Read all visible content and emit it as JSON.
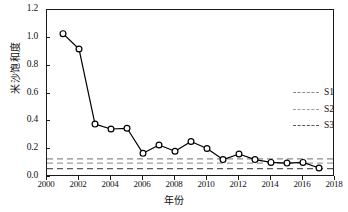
{
  "chart_data": {
    "type": "line",
    "title": "",
    "xlabel": "年份",
    "ylabel": "米沙饱和度",
    "xlim": [
      2000,
      2018
    ],
    "ylim": [
      0.0,
      1.2
    ],
    "xticks": [
      2000,
      2002,
      2004,
      2006,
      2008,
      2010,
      2012,
      2014,
      2016,
      2018
    ],
    "yticks": [
      "0.0",
      "0.2",
      "0.4",
      "0.6",
      "0.8",
      "1.0",
      "1.2"
    ],
    "grid": false,
    "legend_position": "center-right",
    "series": [
      {
        "name": "米沙饱和度",
        "marker": "open-circle",
        "color": "#000000",
        "x": [
          2001,
          2002,
          2003,
          2004,
          2005,
          2006,
          2007,
          2008,
          2009,
          2010,
          2011,
          2012,
          2013,
          2014,
          2015,
          2016,
          2017
        ],
        "values": [
          1.03,
          0.92,
          0.38,
          0.345,
          0.35,
          0.17,
          0.23,
          0.185,
          0.255,
          0.205,
          0.125,
          0.165,
          0.125,
          0.105,
          0.1,
          0.105,
          0.065
        ]
      }
    ],
    "reference_lines": [
      {
        "name": "S1",
        "value": 0.13,
        "style": "dashed",
        "color": "#8c8c8c"
      },
      {
        "name": "S2",
        "value": 0.1,
        "style": "dashed",
        "color": "#9e9e9e"
      },
      {
        "name": "S3",
        "value": 0.06,
        "style": "dashed",
        "color": "#5a5a5a"
      }
    ]
  },
  "legend": {
    "items": [
      {
        "label": "S1",
        "color": "#8c8c8c"
      },
      {
        "label": "S2",
        "color": "#9e9e9e"
      },
      {
        "label": "S3",
        "color": "#5a5a5a"
      }
    ]
  }
}
